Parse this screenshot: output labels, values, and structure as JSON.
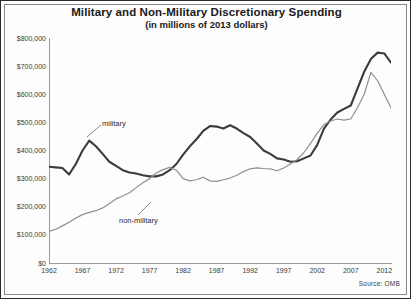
{
  "chart_data": {
    "type": "line",
    "title": "Military and Non-Military Discretionary Spending",
    "subtitle": "(in millions of 2013 dollars)",
    "xlabel": "",
    "ylabel": "",
    "source": "Source: OMB",
    "grid": false,
    "legend_position": "inline-annotation",
    "xlim": [
      1962,
      2013
    ],
    "ylim": [
      0,
      800000
    ],
    "ytick_labels": [
      "$800,000",
      "$700,000",
      "$600,000",
      "$500,000",
      "$400,000",
      "$300,000",
      "$200,000",
      "$100,000",
      "$0"
    ],
    "ytick_values": [
      800000,
      700000,
      600000,
      500000,
      400000,
      300000,
      200000,
      100000,
      0
    ],
    "xtick_labels": [
      "1962",
      "1967",
      "1972",
      "1977",
      "1982",
      "1987",
      "1992",
      "1997",
      "2002",
      "2007",
      "2012"
    ],
    "xtick_values": [
      1962,
      1967,
      1972,
      1977,
      1982,
      1987,
      1992,
      1997,
      2002,
      2007,
      2012
    ],
    "x": [
      1962,
      1963,
      1964,
      1965,
      1966,
      1967,
      1968,
      1969,
      1970,
      1971,
      1972,
      1973,
      1974,
      1975,
      1976,
      1977,
      1978,
      1979,
      1980,
      1981,
      1982,
      1983,
      1984,
      1985,
      1986,
      1987,
      1988,
      1989,
      1990,
      1991,
      1992,
      1993,
      1994,
      1995,
      1996,
      1997,
      1998,
      1999,
      2000,
      2001,
      2002,
      2003,
      2004,
      2005,
      2006,
      2007,
      2008,
      2009,
      2010,
      2011,
      2012,
      2013
    ],
    "series": [
      {
        "name": "military",
        "label": "military",
        "color": "#3b3b3b",
        "width": 2.1,
        "values": [
          342000,
          340000,
          338000,
          315000,
          352000,
          400000,
          435000,
          415000,
          388000,
          360000,
          345000,
          330000,
          322000,
          318000,
          312000,
          308000,
          308000,
          315000,
          330000,
          352000,
          385000,
          415000,
          440000,
          470000,
          487000,
          485000,
          478000,
          490000,
          478000,
          462000,
          448000,
          425000,
          400000,
          388000,
          372000,
          368000,
          360000,
          362000,
          372000,
          382000,
          420000,
          478000,
          510000,
          535000,
          548000,
          560000,
          620000,
          680000,
          725000,
          748000,
          745000,
          712000
        ]
      },
      {
        "name": "non-military",
        "label": "non-military",
        "color": "#8f8f8f",
        "width": 1.2,
        "values": [
          112000,
          120000,
          132000,
          145000,
          160000,
          172000,
          180000,
          186000,
          196000,
          212000,
          228000,
          238000,
          250000,
          268000,
          285000,
          300000,
          320000,
          332000,
          340000,
          330000,
          300000,
          292000,
          296000,
          305000,
          292000,
          290000,
          296000,
          302000,
          312000,
          325000,
          335000,
          338000,
          336000,
          335000,
          328000,
          338000,
          352000,
          368000,
          392000,
          425000,
          462000,
          492000,
          505000,
          512000,
          508000,
          512000,
          552000,
          600000,
          678000,
          648000,
          600000,
          552000
        ]
      }
    ],
    "annotations": [
      {
        "text": "military",
        "series": "military",
        "points_to_year": 1969
      },
      {
        "text": "non-military",
        "series": "non-military",
        "points_to_year": 1979
      }
    ]
  }
}
